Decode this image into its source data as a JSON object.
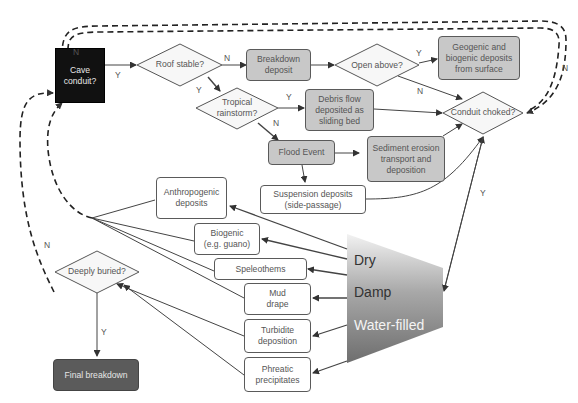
{
  "colors": {
    "shaded_fill": "#c8c8c8",
    "start_fill": "#111111",
    "end_fill": "#5b5b5b",
    "diamond_fill": "#f7f7f7",
    "line": "#444444"
  },
  "start": {
    "label": "Cave\nconduit?"
  },
  "decisions": {
    "roof_stable": "Roof stable?",
    "tropical_rainstorm": "Tropical\nrainstorm?",
    "open_above": "Open above?",
    "conduit_choked": "Conduit choked?",
    "deeply_buried": "Deeply buried?"
  },
  "process_nodes": {
    "breakdown_deposit": "Breakdown\ndeposit",
    "geogenic_biogenic": "Geogenic and\nbiogenic deposits\nfrom surface",
    "debris_flow": "Debris flow\ndeposited as\nsliding bed",
    "flood_event": "Flood Event",
    "sediment_erosion": "Sediment erosion\ntransport and\ndeposition"
  },
  "deposit_nodes": {
    "suspension": "Suspension deposits\n(side-passage)",
    "anthropogenic": "Anthropogenic\ndeposits",
    "biogenic": "Biogenic\n(e.g. guano)",
    "speleothems": "Speleothems",
    "mud_drape": "Mud\ndrape",
    "turbidite": "Turbidite\ndeposition",
    "phreatic": "Phreatic\nprecipitates"
  },
  "end": {
    "label": "Final breakdown"
  },
  "zones": {
    "dry": "Dry",
    "damp": "Damp",
    "water_filled": "Water-filled"
  },
  "edge_labels": {
    "start_top_n": "N",
    "start_to_roof_y": "Y",
    "roof_to_breakdown_n": "N",
    "roof_to_rainstorm_y": "Y",
    "rainstorm_to_debris_y": "Y",
    "rainstorm_to_flood_n": "N",
    "open_above_y": "Y",
    "open_above_n": "N",
    "choked_loop_n": "N",
    "choked_to_zone_y": "Y",
    "buried_n": "N",
    "buried_y": "Y"
  }
}
